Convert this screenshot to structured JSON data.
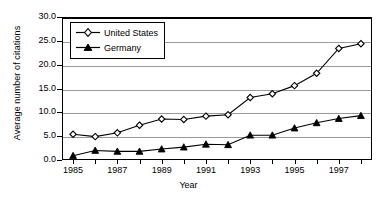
{
  "chart_data": {
    "type": "line",
    "title": "",
    "xlabel": "Year",
    "ylabel": "Average number of citations",
    "x": [
      1985,
      1986,
      1987,
      1988,
      1989,
      1990,
      1991,
      1992,
      1993,
      1994,
      1995,
      1996,
      1997,
      1998
    ],
    "categories": [
      "1985",
      "1986",
      "1987",
      "1988",
      "1989",
      "1990",
      "1991",
      "1992",
      "1993",
      "1994",
      "1995",
      "1996",
      "1997",
      "1998"
    ],
    "series": [
      {
        "name": "United States",
        "marker": "diamond-open",
        "values": [
          5.4,
          4.9,
          5.7,
          7.3,
          8.6,
          8.5,
          9.2,
          9.5,
          13.1,
          13.9,
          15.6,
          18.2,
          23.4,
          24.4
        ]
      },
      {
        "name": "Germany",
        "marker": "triangle-filled",
        "values": [
          0.9,
          2.0,
          1.8,
          1.8,
          2.3,
          2.7,
          3.3,
          3.2,
          5.2,
          5.2,
          6.7,
          7.8,
          8.7,
          9.3
        ]
      }
    ],
    "ylim": [
      0,
      30
    ],
    "yticks": [
      0,
      5,
      10,
      15,
      20,
      25,
      30
    ],
    "ytick_labels": [
      "0.0",
      "5.0",
      "10.0",
      "15.0",
      "20.0",
      "25.0",
      "30.0"
    ],
    "xtick_labels": [
      "1985",
      "1987",
      "1989",
      "1991",
      "1993",
      "1995",
      "1997"
    ],
    "xtick_values": [
      1985,
      1987,
      1989,
      1991,
      1993,
      1995,
      1997
    ],
    "xlim": [
      1984.5,
      1998.5
    ],
    "grid": "horizontal",
    "grid_color": "#9a9a9a",
    "legend_position": "top-left",
    "line_color": "#000000",
    "background": "#ffffff"
  },
  "legend": {
    "entries": [
      {
        "label": "United States"
      },
      {
        "label": "Germany"
      }
    ]
  },
  "axes": {
    "y_title": "Average number of citations",
    "x_title": "Year"
  }
}
